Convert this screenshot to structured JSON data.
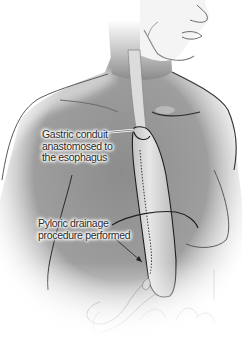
{
  "figure": {
    "style": "grayscale anatomical illustration",
    "colors": {
      "background": "#ffffff",
      "skin_dark": "#7a7a7a",
      "skin_mid": "#a8a8a8",
      "conduit": "#d6d6d6",
      "outline": "#1e1e1e",
      "label_text": "#2a2a2a"
    }
  },
  "labels": {
    "conduit": {
      "lines": [
        "Gastric conduit",
        "anastomosed to",
        "the esophagus"
      ]
    },
    "pyloric": {
      "lines": [
        "Pyloric drainage",
        "procedure performed"
      ]
    }
  }
}
